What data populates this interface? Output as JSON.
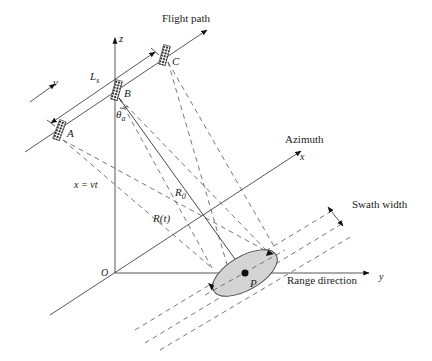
{
  "diagram": {
    "labels": {
      "flight_path": "Flight path",
      "z_axis": "z",
      "velocity": "v",
      "synthetic_length": "Ls",
      "synthetic_length_base": "L",
      "synthetic_length_sub": "s",
      "point_a": "A",
      "point_b": "B",
      "point_c": "C",
      "beam_angle": "θ",
      "beam_angle_sub": "a",
      "azimuth": "Azimuth",
      "x_axis": "x",
      "x_eq": "x = vt",
      "r0": "R",
      "r0_sub": "0",
      "rt": "R(t)",
      "origin": "O",
      "target": "P",
      "range_direction": "Range direction",
      "y_axis": "y",
      "swath_width": "Swath width"
    },
    "colors": {
      "line": "#444444",
      "footprint_fill": "#d4d4d4",
      "satellite": "#333333"
    }
  }
}
